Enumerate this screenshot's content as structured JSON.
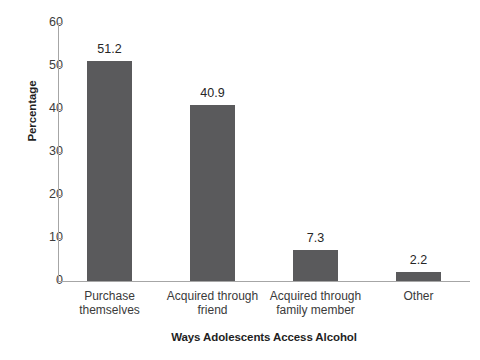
{
  "chart_data": {
    "type": "bar",
    "title": "",
    "subtitle": "",
    "xlabel": "Ways Adolescents Access Alcohol",
    "ylabel": "Percentage",
    "categories": [
      "Purchase themselves",
      "Acquired through friend",
      "Acquired through family member",
      "Other"
    ],
    "category_lines": [
      [
        "Purchase",
        "themselves"
      ],
      [
        "Acquired through",
        "friend"
      ],
      [
        "Acquired through",
        "family member"
      ],
      [
        "Other"
      ]
    ],
    "values": [
      51.2,
      40.9,
      7.3,
      2.2
    ],
    "value_labels": [
      "51.2",
      "40.9",
      "7.3",
      "2.2"
    ],
    "ylim": [
      0,
      60
    ],
    "yticks": [
      0,
      10,
      20,
      30,
      40,
      50,
      60
    ],
    "ytick_labels": [
      "0",
      "10",
      "20",
      "30",
      "40",
      "50",
      "60"
    ],
    "grid": false,
    "legend": null,
    "legend_position": "none",
    "bar_color": "#5a5a5c",
    "axis_color": "#a6a6a6",
    "background_color": "#ffffff",
    "text_color": "#262626"
  }
}
